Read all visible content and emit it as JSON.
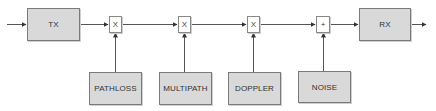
{
  "diagram": {
    "title": "",
    "colors": {
      "block_fill": "#d9d9d9",
      "block_border": "#7a7a7a",
      "line": "#444444",
      "op_fill": "#ffffff"
    },
    "main_chain": [
      {
        "id": "tx",
        "label": "TX",
        "type": "block"
      },
      {
        "id": "mult1",
        "label": "X",
        "type": "multiplier"
      },
      {
        "id": "mult2",
        "label": "X",
        "type": "multiplier"
      },
      {
        "id": "mult3",
        "label": "X",
        "type": "multiplier"
      },
      {
        "id": "adder",
        "label": "+",
        "type": "adder"
      },
      {
        "id": "rx",
        "label": "RX",
        "type": "block"
      }
    ],
    "side_inputs": [
      {
        "id": "pathloss",
        "label": "PATHLOSS",
        "feeds": "mult1"
      },
      {
        "id": "multipath",
        "label": "MULTIPATH",
        "feeds": "mult2"
      },
      {
        "id": "doppler",
        "label": "DOPPLER",
        "feeds": "mult3"
      },
      {
        "id": "noise",
        "label": "NOISE",
        "feeds": "adder"
      }
    ],
    "edges": [
      [
        "input",
        "tx"
      ],
      [
        "tx",
        "mult1"
      ],
      [
        "mult1",
        "mult2"
      ],
      [
        "mult2",
        "mult3"
      ],
      [
        "mult3",
        "adder"
      ],
      [
        "adder",
        "rx"
      ],
      [
        "rx",
        "output"
      ],
      [
        "pathloss",
        "mult1"
      ],
      [
        "multipath",
        "mult2"
      ],
      [
        "doppler",
        "mult3"
      ],
      [
        "noise",
        "adder"
      ]
    ]
  }
}
